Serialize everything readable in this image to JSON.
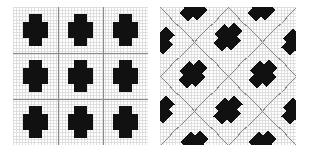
{
  "figure": {
    "background_color": "#ffffff",
    "width": 310,
    "height": 153,
    "panel_count": 2
  },
  "colors": {
    "blob_fill": "#111111",
    "fine_grid": "#d8d8d8",
    "major_grid": "#8a8a8a",
    "panel_background": "#ffffff",
    "page_background": "#ffffff"
  },
  "panels": [
    {
      "id": "panel-left",
      "name": "aligned-lattice-panel",
      "caption": "",
      "grid_type": "orthogonal",
      "fine_grid_spacing": 3.1,
      "major_grid_divisions": 3,
      "blob_rotation_deg": 0,
      "blob_shape": "cross",
      "lattice_rows": 3,
      "lattice_cols": 3
    },
    {
      "id": "panel-right",
      "name": "rotated-lattice-panel",
      "caption": "",
      "grid_type": "diamond",
      "fine_grid_spacing": 3.1,
      "major_grid_divisions": 4,
      "blob_rotation_deg": 45,
      "blob_shape": "cross",
      "lattice_rows": 3,
      "lattice_cols": 3
    }
  ],
  "chart_data": {
    "type": "heatmap",
    "title": "",
    "subtitle": "",
    "xlabel": "",
    "ylabel": "",
    "grid": true,
    "legend": "none",
    "xlim": [
      0,
      1
    ],
    "ylim": [
      0,
      1
    ],
    "panels": [
      {
        "name": "aligned-lattice-panel",
        "description": "Square domain discretized by a fine uniform mesh with darker major gridlines dividing it into a 3 by 3 block structure; nine black cross shaped inclusions sit at the centre of each block.",
        "mesh": {
          "type": "uniform-cartesian",
          "fine_divisions": 44,
          "major_x": [
            0.3333,
            0.6667
          ],
          "major_y": [
            0.3333,
            0.6667
          ]
        },
        "inclusions": [
          {
            "cx": 0.1667,
            "cy": 0.1667,
            "rx": 0.095,
            "ry": 0.115,
            "value": 1
          },
          {
            "cx": 0.5,
            "cy": 0.1667,
            "rx": 0.095,
            "ry": 0.115,
            "value": 1
          },
          {
            "cx": 0.8333,
            "cy": 0.1667,
            "rx": 0.095,
            "ry": 0.115,
            "value": 1
          },
          {
            "cx": 0.1667,
            "cy": 0.5,
            "rx": 0.095,
            "ry": 0.115,
            "value": 1
          },
          {
            "cx": 0.5,
            "cy": 0.5,
            "rx": 0.095,
            "ry": 0.115,
            "value": 1
          },
          {
            "cx": 0.8333,
            "cy": 0.5,
            "rx": 0.095,
            "ry": 0.115,
            "value": 1
          },
          {
            "cx": 0.1667,
            "cy": 0.8333,
            "rx": 0.095,
            "ry": 0.115,
            "value": 1
          },
          {
            "cx": 0.5,
            "cy": 0.8333,
            "rx": 0.095,
            "ry": 0.115,
            "value": 1
          },
          {
            "cx": 0.8333,
            "cy": 0.8333,
            "rx": 0.095,
            "ry": 0.115,
            "value": 1
          }
        ]
      },
      {
        "name": "rotated-lattice-panel",
        "description": "Same fine uniform mesh, but the darker major gridlines run diagonally forming an X / diamond pattern; the black cross shaped inclusions follow the rotated lattice so that some are cut by the square boundary.",
        "mesh": {
          "type": "uniform-cartesian-with-diagonal-majors",
          "fine_divisions": 44,
          "diagonal_offsets": [
            -0.5,
            0.0,
            0.5,
            1.0,
            1.5
          ]
        },
        "inclusions": [
          {
            "cx": 0.0,
            "cy": 0.25,
            "rx": 0.085,
            "ry": 0.105,
            "value": 1
          },
          {
            "cx": 0.0,
            "cy": 0.75,
            "rx": 0.085,
            "ry": 0.105,
            "value": 1
          },
          {
            "cx": 1.0,
            "cy": 0.25,
            "rx": 0.085,
            "ry": 0.105,
            "value": 1
          },
          {
            "cx": 1.0,
            "cy": 0.75,
            "rx": 0.085,
            "ry": 0.105,
            "value": 1
          },
          {
            "cx": 0.25,
            "cy": 0.0,
            "rx": 0.085,
            "ry": 0.105,
            "value": 1
          },
          {
            "cx": 0.75,
            "cy": 0.0,
            "rx": 0.085,
            "ry": 0.105,
            "value": 1
          },
          {
            "cx": 0.25,
            "cy": 1.0,
            "rx": 0.085,
            "ry": 0.105,
            "value": 1
          },
          {
            "cx": 0.75,
            "cy": 1.0,
            "rx": 0.085,
            "ry": 0.105,
            "value": 1
          },
          {
            "cx": 0.5,
            "cy": 0.22,
            "rx": 0.085,
            "ry": 0.105,
            "value": 1
          },
          {
            "cx": 0.5,
            "cy": 0.75,
            "rx": 0.085,
            "ry": 0.105,
            "value": 1
          },
          {
            "cx": 0.24,
            "cy": 0.485,
            "rx": 0.085,
            "ry": 0.105,
            "value": 1
          },
          {
            "cx": 0.76,
            "cy": 0.485,
            "rx": 0.085,
            "ry": 0.105,
            "value": 1
          }
        ]
      }
    ]
  }
}
